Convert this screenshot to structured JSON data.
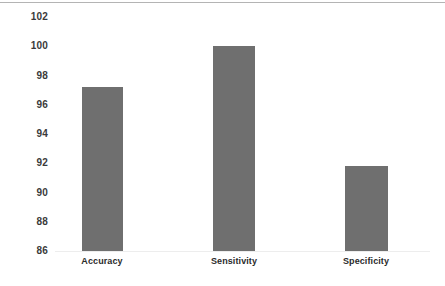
{
  "chart_data": {
    "type": "bar",
    "title": "",
    "subtitle": "",
    "xlabel": "",
    "ylabel": "",
    "categories": [
      "Accuracy",
      "Sensitivity",
      "Specificity"
    ],
    "values": [
      97.2,
      100.0,
      91.8
    ],
    "series": [
      {
        "name": "Performance",
        "values": [
          97.2,
          100.0,
          91.8
        ]
      }
    ],
    "ylim": [
      86,
      102
    ],
    "yticks": [
      86,
      88,
      90,
      92,
      94,
      96,
      98,
      100,
      102
    ],
    "ytick_labels": [
      "86",
      "88",
      "90",
      "92",
      "94",
      "96",
      "98",
      "100",
      "102"
    ],
    "grid": false,
    "legend": "none",
    "bar_color": "#6f6f6f",
    "axis_text_color": "#3a3a3a",
    "category_text_color": "#2b2b2b",
    "background_color": "#ffffff",
    "top_rule_color": "#b4b4b4",
    "baseline_color": "#ededed"
  },
  "axis": {
    "ticks": [
      {
        "label": "102",
        "value": 102
      },
      {
        "label": "100",
        "value": 100
      },
      {
        "label": "98",
        "value": 98
      },
      {
        "label": "96",
        "value": 96
      },
      {
        "label": "94",
        "value": 94
      },
      {
        "label": "92",
        "value": 92
      },
      {
        "label": "90",
        "value": 90
      },
      {
        "label": "88",
        "value": 88
      },
      {
        "label": "86",
        "value": 86
      }
    ]
  },
  "bars": [
    {
      "label": "Accuracy",
      "value": 97.2
    },
    {
      "label": "Sensitivity",
      "value": 100.0
    },
    {
      "label": "Specificity",
      "value": 91.8
    }
  ]
}
